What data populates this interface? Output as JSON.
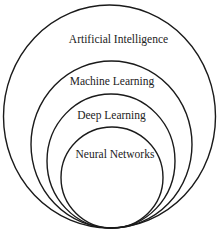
{
  "diagram": {
    "type": "nested-circles",
    "stroke_color": "#1a1a1a",
    "text_color": "#222222",
    "background": "#ffffff",
    "rings": [
      {
        "label": "Artificial Intelligence",
        "level": 1
      },
      {
        "label": "Machine Learning",
        "level": 2
      },
      {
        "label": "Deep Learning",
        "level": 3
      },
      {
        "label": "Neural Networks",
        "level": 4
      }
    ]
  }
}
